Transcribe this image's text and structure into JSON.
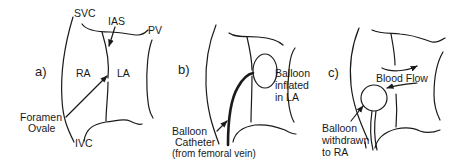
{
  "figure": {
    "panels": [
      {
        "id": "a",
        "label": "a)",
        "labels": {
          "svc": "SVC",
          "ias": "IAS",
          "pv": "PV",
          "ra": "RA",
          "la": "LA",
          "foramen_line1": "Foramen",
          "foramen_line2": "Ovale",
          "ivc": "IVC"
        }
      },
      {
        "id": "b",
        "label": "b)",
        "labels": {
          "balloon_inflated_line1": "Balloon",
          "balloon_inflated_line2": "inflated",
          "balloon_inflated_line3": "in LA",
          "catheter_line1": "Balloon",
          "catheter_line2": "Catheter",
          "catheter_line3": "(from femoral vein)"
        }
      },
      {
        "id": "c",
        "label": "c)",
        "labels": {
          "blood_flow": "Blood Flow",
          "withdrawn_line1": "Balloon",
          "withdrawn_line2": "withdrawn",
          "withdrawn_line3": "to RA"
        }
      }
    ],
    "colors": {
      "ink": "#1a1a1a",
      "background": "#ffffff"
    }
  }
}
